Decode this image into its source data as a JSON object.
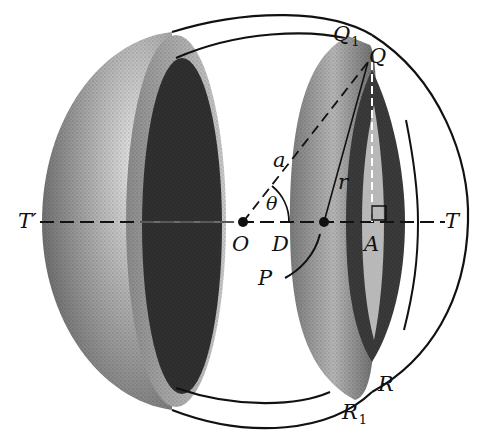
{
  "figure": {
    "labels": {
      "Q1": {
        "main": "Q",
        "sub": "1"
      },
      "Q": {
        "main": "Q"
      },
      "a": {
        "main": "a"
      },
      "r": {
        "main": "r"
      },
      "theta": {
        "main": "θ"
      },
      "T_prime": {
        "main": "T′"
      },
      "T": {
        "main": "T"
      },
      "O": {
        "main": "O"
      },
      "D": {
        "main": "D"
      },
      "A": {
        "main": "A"
      },
      "P": {
        "main": "P"
      },
      "R": {
        "main": "R"
      },
      "R1": {
        "main": "R",
        "sub": "1"
      }
    },
    "colors": {
      "ink": "#111111",
      "shade_dark": "#2a2a2a",
      "shade_mid": "#6e6e6e",
      "shade_light": "#bdbdbd",
      "background": "#ffffff"
    }
  }
}
